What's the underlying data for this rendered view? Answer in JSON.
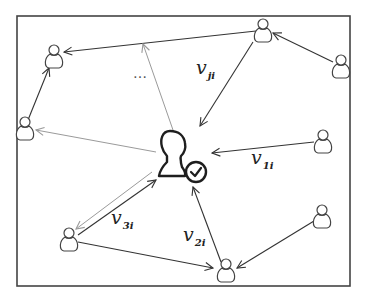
{
  "diagram": {
    "type": "social-influence-network",
    "frame": {
      "x": 17,
      "y": 16,
      "width": 333,
      "height": 270,
      "stroke": "#444444"
    },
    "center_user": {
      "label": "user i (verified)",
      "x": 175,
      "y": 155,
      "badge": "check-circle"
    },
    "nodes": [
      {
        "id": "A",
        "x": 54,
        "y": 58
      },
      {
        "id": "B",
        "x": 263,
        "y": 30
      },
      {
        "id": "C",
        "x": 341,
        "y": 66
      },
      {
        "id": "D",
        "x": 323,
        "y": 142
      },
      {
        "id": "E",
        "x": 25,
        "y": 129
      },
      {
        "id": "F",
        "x": 69,
        "y": 240
      },
      {
        "id": "G",
        "x": 226,
        "y": 271
      },
      {
        "id": "H",
        "x": 322,
        "y": 217
      }
    ],
    "edges": [
      {
        "from": "B",
        "to": "A",
        "weight": "dark"
      },
      {
        "from": "E",
        "to": "A",
        "weight": "dark"
      },
      {
        "from": "C",
        "to": "B",
        "weight": "dark"
      },
      {
        "from": "B",
        "to": "center",
        "weight": "dark",
        "label": "v_ji"
      },
      {
        "from": "D",
        "to": "center",
        "weight": "dark",
        "label": "v_1i"
      },
      {
        "from": "G",
        "to": "center",
        "weight": "dark",
        "label": "v_2i"
      },
      {
        "from": "F",
        "to": "center",
        "weight": "dark",
        "label": "v_3i"
      },
      {
        "from": "center",
        "to": "F",
        "weight": "light"
      },
      {
        "from": "center",
        "to": "E",
        "weight": "light"
      },
      {
        "from": "center",
        "to": "B",
        "weight": "light"
      },
      {
        "from": "F",
        "to": "G",
        "weight": "dark"
      },
      {
        "from": "H",
        "to": "G",
        "weight": "dark"
      }
    ],
    "labels": {
      "vji": {
        "main": "v",
        "sub": "ji"
      },
      "v1i": {
        "main": "v",
        "sub": "1i"
      },
      "v2i": {
        "main": "v",
        "sub": "2i"
      },
      "v3i": {
        "main": "v",
        "sub": "3i"
      },
      "ellipsis": "…"
    },
    "colors": {
      "dark": "#333333",
      "light": "#9a9a9a",
      "frame": "#444444"
    }
  }
}
